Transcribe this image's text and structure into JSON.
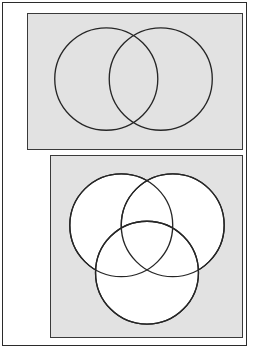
{
  "page": {
    "background_color": "#ffffff",
    "frame_color": "#2b2b2b",
    "width": 262,
    "height": 360
  },
  "panels": [
    {
      "id": "two-set",
      "name": "two-circle-venn-panel",
      "caption": "",
      "background_color": "#e2e2e2",
      "border_color": "#3a3a3a",
      "circle_fill": "none",
      "circle_stroke": "#262626",
      "rect": {
        "x": 24,
        "y": 10,
        "width": 216,
        "height": 137
      },
      "circles": [
        {
          "name": "set-a-circle",
          "cx": 79,
          "cy": 66,
          "r": 52
        },
        {
          "name": "set-b-circle",
          "cx": 134,
          "cy": 66,
          "r": 52
        }
      ]
    },
    {
      "id": "three-set",
      "name": "three-circle-venn-panel",
      "caption": "",
      "background_color": "#e2e2e2",
      "border_color": "#3a3a3a",
      "circle_fill": "#ffffff",
      "circle_stroke": "#262626",
      "rect": {
        "x": 47,
        "y": 152,
        "width": 193,
        "height": 183
      },
      "circles": [
        {
          "name": "set-a-circle",
          "cx": 71,
          "cy": 70,
          "r": 52
        },
        {
          "name": "set-b-circle",
          "cx": 123,
          "cy": 70,
          "r": 52
        },
        {
          "name": "set-c-circle",
          "cx": 97,
          "cy": 118,
          "r": 52
        }
      ]
    }
  ],
  "chart_data": {
    "type": "diagram",
    "title": "",
    "figures": [
      {
        "label": "two-set Venn diagram",
        "set_count": 2,
        "regions": 4,
        "sets": [
          "A",
          "B"
        ],
        "fill": "unfilled (panel grey shows through)"
      },
      {
        "label": "three-set Venn diagram",
        "set_count": 3,
        "regions": 8,
        "sets": [
          "A",
          "B",
          "C"
        ],
        "fill": "white"
      }
    ]
  }
}
